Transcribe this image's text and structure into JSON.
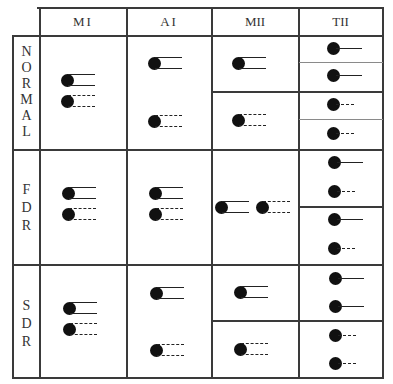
{
  "table": {
    "columns": [
      "MI",
      "AI",
      "MII",
      "TII"
    ],
    "rows": [
      {
        "label": "NORMAL",
        "letters": [
          "N",
          "O",
          "R",
          "M",
          "A",
          "L"
        ]
      },
      {
        "label": "FDR",
        "letters": [
          "F",
          "D",
          "R"
        ]
      },
      {
        "label": "SDR",
        "letters": [
          "S",
          "D",
          "R"
        ]
      }
    ],
    "legend_semantics": {
      "solid": "solid line glyph",
      "dashed": "dashed line glyph",
      "double": "dot with two parallel lines",
      "single": "dot with single line"
    },
    "cells": {
      "NORMAL": {
        "MI": [
          "double-solid",
          "double-dashed"
        ],
        "AI": [
          "double-solid",
          "double-dashed"
        ],
        "MII": [
          [
            "double-solid"
          ],
          [
            "double-dashed"
          ]
        ],
        "TII": [
          [
            "single-solid"
          ],
          [
            "single-solid"
          ],
          [
            "single-dashed"
          ],
          [
            "single-dashed"
          ]
        ]
      },
      "FDR": {
        "MI": [
          "double-solid",
          "double-dashed"
        ],
        "AI": [
          "double-solid",
          "double-dashed"
        ],
        "MII": [
          "double-solid",
          "double-dashed"
        ],
        "TII": [
          [
            "single-solid",
            "single-dashed"
          ],
          [
            "single-solid",
            "single-dashed"
          ]
        ]
      },
      "SDR": {
        "MI": [
          "double-solid",
          "double-dashed"
        ],
        "AI": [
          "double-solid",
          "double-dashed"
        ],
        "MII": [
          [
            "double-solid"
          ],
          [
            "double-dashed"
          ]
        ],
        "TII": [
          [
            "single-solid",
            "single-solid"
          ],
          [
            "single-dashed",
            "single-dashed"
          ]
        ]
      }
    }
  }
}
